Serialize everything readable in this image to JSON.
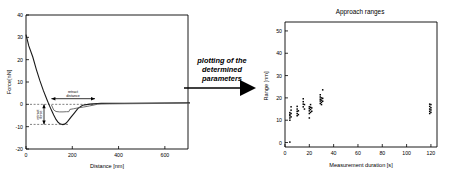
{
  "figure": {
    "transition_label": "plotting of the\ndetermined\nparameters"
  },
  "left_chart": {
    "title": "",
    "xlabel": "Distance [nm]",
    "ylabel": "Force[nN]",
    "xticks": [
      "0",
      "200",
      "400",
      "600"
    ],
    "yticks": [
      "40",
      "30",
      "20",
      "10",
      "0",
      "-10",
      "-20"
    ],
    "annotations": {
      "retract_distance": "retract\ndistance",
      "retract_force": "retract\nforce"
    }
  },
  "right_chart": {
    "title": "Approach ranges",
    "xlabel": "Measurement duration [s]",
    "ylabel": "Range [nm]",
    "xticks": [
      "0",
      "20",
      "40",
      "60",
      "80",
      "100",
      "120"
    ],
    "yticks": [
      "0",
      "10",
      "20",
      "30",
      "40",
      "50"
    ]
  },
  "chart_data": [
    {
      "type": "line",
      "id": "force-distance-curve",
      "title": "",
      "xlabel": "Distance [nm]",
      "ylabel": "Force[nN]",
      "xlim": [
        0,
        700
      ],
      "ylim": [
        -20,
        40
      ],
      "grid": false,
      "legend": null,
      "annotations": [
        {
          "text": "retract distance",
          "x_start": 110,
          "y": 2.5,
          "x_end": 300
        },
        {
          "text": "retract force",
          "x": 60,
          "y_top": 0,
          "y_bottom": -9
        }
      ],
      "series": [
        {
          "name": "approach",
          "points": [
            [
              0,
              31
            ],
            [
              12,
              26
            ],
            [
              25,
              21
            ],
            [
              40,
              15.5
            ],
            [
              55,
              10.5
            ],
            [
              70,
              6.0
            ],
            [
              85,
              2.0
            ],
            [
              95,
              -0.5
            ],
            [
              105,
              -2.8
            ],
            [
              115,
              -5.0
            ],
            [
              125,
              -7.0
            ],
            [
              135,
              -8.4
            ],
            [
              145,
              -9.1
            ],
            [
              155,
              -9.3
            ],
            [
              165,
              -9.0
            ],
            [
              175,
              -8.0
            ],
            [
              190,
              -6.0
            ],
            [
              205,
              -4.0
            ],
            [
              220,
              -2.0
            ],
            [
              240,
              -0.6
            ],
            [
              270,
              -0.1
            ],
            [
              320,
              0.2
            ],
            [
              420,
              0.3
            ],
            [
              560,
              0.4
            ],
            [
              700,
              0.5
            ]
          ]
        },
        {
          "name": "retract",
          "points": [
            [
              110,
              -0.2
            ],
            [
              120,
              -2.5
            ],
            [
              130,
              -3.2
            ],
            [
              145,
              -3.4
            ],
            [
              160,
              -3.4
            ],
            [
              175,
              -3.3
            ],
            [
              185,
              -3.3
            ],
            [
              190,
              -2.3
            ],
            [
              205,
              -2.0
            ],
            [
              225,
              -1.6
            ],
            [
              250,
              -1.2
            ],
            [
              275,
              -0.7
            ],
            [
              295,
              -0.3
            ],
            [
              310,
              0.1
            ],
            [
              360,
              0.2
            ],
            [
              460,
              0.3
            ],
            [
              600,
              0.4
            ],
            [
              700,
              0.5
            ]
          ]
        }
      ]
    },
    {
      "type": "scatter",
      "id": "approach-ranges",
      "title": "Approach ranges",
      "xlabel": "Measurement duration [s]",
      "ylabel": "Range [nm]",
      "xlim": [
        0,
        125
      ],
      "ylim": [
        -2,
        54
      ],
      "grid": false,
      "legend": null,
      "points": [
        [
          4,
          0.2
        ],
        [
          4,
          10.0
        ],
        [
          4,
          11.0
        ],
        [
          4,
          12.0
        ],
        [
          4,
          12.6
        ],
        [
          4,
          13.4
        ],
        [
          5,
          16.0
        ],
        [
          5,
          14.5
        ],
        [
          5,
          13.0
        ],
        [
          5,
          11.5
        ],
        [
          10,
          12.0
        ],
        [
          10,
          13.0
        ],
        [
          10,
          14.0
        ],
        [
          10,
          15.0
        ],
        [
          10,
          16.2
        ],
        [
          11,
          12.5
        ],
        [
          11,
          14.2
        ],
        [
          15,
          16.0
        ],
        [
          15,
          17.2
        ],
        [
          15,
          18.3
        ],
        [
          15,
          19.6
        ],
        [
          16,
          15.0
        ],
        [
          16,
          17.0
        ],
        [
          20,
          11.0
        ],
        [
          20,
          13.0
        ],
        [
          20,
          14.2
        ],
        [
          20,
          15.2
        ],
        [
          20,
          16.0
        ],
        [
          21,
          13.5
        ],
        [
          21,
          14.8
        ],
        [
          21,
          15.8
        ],
        [
          21,
          17.0
        ],
        [
          22,
          14.0
        ],
        [
          22,
          15.5
        ],
        [
          29,
          17.5
        ],
        [
          29,
          18.6
        ],
        [
          29,
          19.4
        ],
        [
          29,
          20.4
        ],
        [
          29,
          21.4
        ],
        [
          30,
          17.0
        ],
        [
          30,
          18.0
        ],
        [
          30,
          19.0
        ],
        [
          30,
          20.0
        ],
        [
          31,
          18.5
        ],
        [
          31,
          19.8
        ],
        [
          31,
          23.6
        ],
        [
          119,
          13.0
        ],
        [
          119,
          14.0
        ],
        [
          119,
          15.0
        ],
        [
          119,
          16.2
        ],
        [
          119,
          17.2
        ],
        [
          120,
          13.5
        ],
        [
          120,
          14.6
        ],
        [
          120,
          15.6
        ],
        [
          120,
          17.0
        ]
      ]
    }
  ]
}
